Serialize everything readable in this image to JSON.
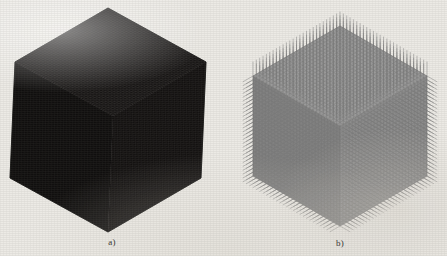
{
  "figure": {
    "background_color": "#eceae5",
    "panels": [
      {
        "id": "a",
        "caption": "a)",
        "subject": "dense dark finite-element cube mesh in isometric view",
        "fill_color": "#1b1917",
        "edge_color": "#0d0c0b",
        "mesh_divisions": 44,
        "geometry": {
          "top_vertex": [
            108,
            8
          ],
          "left_vertex": [
            15,
            62
          ],
          "right_vertex": [
            206,
            62
          ],
          "bottom_vertex": [
            108,
            232
          ],
          "left_bottom_vertex": [
            15,
            178
          ],
          "right_bottom_vertex": [
            206,
            178
          ]
        },
        "face_shades": {
          "top": "#232120",
          "left": "#131211",
          "right": "#1a1817"
        }
      },
      {
        "id": "b",
        "caption": "b)",
        "subject": "gray cube mesh with normal vectors (spikes) protruding from every surface node",
        "fill_color": "#8a8a8a",
        "edge_color": "#6f6f6f",
        "spike_color": "#7c7c7c",
        "mesh_divisions": 28,
        "spike_length": 14,
        "geometry": {
          "top_vertex": [
            340,
            26
          ],
          "left_vertex": [
            253,
            76
          ],
          "right_vertex": [
            427,
            76
          ],
          "bottom_vertex": [
            340,
            226
          ],
          "left_bottom_vertex": [
            253,
            176
          ],
          "right_bottom_vertex": [
            427,
            176
          ]
        },
        "face_shades": {
          "top": "#9a9a9a",
          "left": "#828282",
          "right": "#8d8d8d"
        }
      }
    ]
  },
  "chart_data": {
    "type": "diagram",
    "title": "",
    "panels": [
      {
        "label": "a)",
        "description": "Structured hexahedral volume mesh of a cube, rendered dark; mesh lines so dense the faces read as near-black.",
        "element_count_per_edge": 44
      },
      {
        "label": "b)",
        "description": "Same cube mesh shown in gray with outward surface-normal vectors drawn at each boundary node, producing a spiky silhouette.",
        "element_count_per_edge": 28,
        "normals_shown": true
      }
    ]
  }
}
